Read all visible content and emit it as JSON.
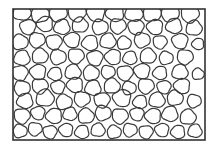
{
  "figure": {
    "frame": {
      "x": 13,
      "y": 9,
      "width": 192,
      "height": 131,
      "stroke": "#333333"
    },
    "stroke_color": "#3a3a3a",
    "circles": [
      [
        22,
        12,
        9
      ],
      [
        40,
        14,
        9
      ],
      [
        58,
        13,
        9
      ],
      [
        77,
        13,
        9
      ],
      [
        96,
        13,
        9
      ],
      [
        115,
        13,
        9
      ],
      [
        134,
        13,
        9
      ],
      [
        152,
        13,
        9
      ],
      [
        170,
        13,
        9
      ],
      [
        190,
        14,
        9
      ],
      [
        28,
        27,
        8
      ],
      [
        45,
        24,
        8
      ],
      [
        62,
        27,
        8
      ],
      [
        80,
        25,
        8
      ],
      [
        100,
        27,
        8
      ],
      [
        118,
        26,
        8
      ],
      [
        136,
        27,
        8
      ],
      [
        155,
        27,
        8
      ],
      [
        174,
        26,
        8
      ],
      [
        194,
        28,
        8
      ],
      [
        20,
        42,
        8
      ],
      [
        37,
        40,
        8
      ],
      [
        54,
        42,
        8
      ],
      [
        72,
        40,
        8
      ],
      [
        90,
        43,
        8
      ],
      [
        108,
        41,
        8
      ],
      [
        124,
        43,
        7
      ],
      [
        142,
        40,
        8
      ],
      [
        160,
        42,
        7
      ],
      [
        180,
        41,
        8
      ],
      [
        198,
        44,
        6
      ],
      [
        22,
        58,
        8
      ],
      [
        40,
        56,
        8
      ],
      [
        58,
        57,
        8
      ],
      [
        76,
        56,
        8
      ],
      [
        95,
        58,
        8
      ],
      [
        113,
        57,
        8
      ],
      [
        130,
        58,
        7
      ],
      [
        148,
        56,
        8
      ],
      [
        166,
        58,
        7
      ],
      [
        185,
        57,
        8
      ],
      [
        20,
        73,
        8
      ],
      [
        38,
        72,
        8
      ],
      [
        55,
        74,
        7
      ],
      [
        73,
        72,
        8
      ],
      [
        91,
        73,
        8
      ],
      [
        108,
        72,
        7
      ],
      [
        125,
        73,
        8
      ],
      [
        142,
        71,
        8
      ],
      [
        160,
        73,
        7
      ],
      [
        180,
        72,
        8
      ],
      [
        198,
        74,
        6
      ],
      [
        22,
        88,
        8
      ],
      [
        40,
        86,
        8
      ],
      [
        58,
        87,
        7
      ],
      [
        75,
        85,
        8
      ],
      [
        93,
        88,
        8
      ],
      [
        112,
        86,
        8
      ],
      [
        129,
        88,
        7
      ],
      [
        146,
        86,
        8
      ],
      [
        164,
        87,
        7
      ],
      [
        182,
        86,
        8
      ],
      [
        25,
        101,
        8
      ],
      [
        45,
        98,
        9
      ],
      [
        64,
        102,
        8
      ],
      [
        82,
        99,
        8
      ],
      [
        102,
        100,
        8
      ],
      [
        122,
        98,
        9
      ],
      [
        140,
        102,
        7
      ],
      [
        157,
        100,
        8
      ],
      [
        175,
        98,
        8
      ],
      [
        194,
        101,
        7
      ],
      [
        22,
        116,
        8
      ],
      [
        38,
        113,
        7
      ],
      [
        54,
        116,
        8
      ],
      [
        70,
        114,
        7
      ],
      [
        86,
        116,
        8
      ],
      [
        103,
        113,
        8
      ],
      [
        120,
        116,
        8
      ],
      [
        137,
        114,
        7
      ],
      [
        153,
        116,
        8
      ],
      [
        170,
        114,
        8
      ],
      [
        188,
        117,
        8
      ],
      [
        20,
        131,
        7
      ],
      [
        35,
        129,
        7
      ],
      [
        50,
        132,
        7
      ],
      [
        66,
        130,
        7
      ],
      [
        82,
        132,
        7
      ],
      [
        98,
        130,
        7
      ],
      [
        114,
        132,
        7
      ],
      [
        130,
        130,
        7
      ],
      [
        146,
        132,
        7
      ],
      [
        162,
        130,
        7
      ],
      [
        178,
        132,
        7
      ],
      [
        195,
        131,
        7
      ]
    ]
  }
}
